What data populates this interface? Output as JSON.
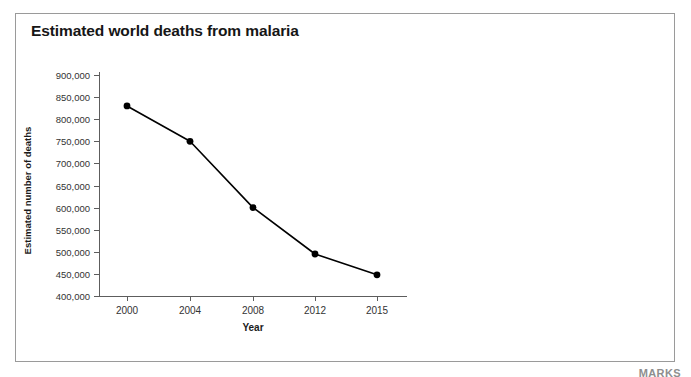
{
  "panel": {
    "accent_color": "#3f3f3f",
    "border_color": "#9a9a9a",
    "background": "#ffffff"
  },
  "watermark": {
    "text": "MARKS"
  },
  "chart_data": {
    "type": "line",
    "title": "Estimated world deaths from malaria",
    "xlabel": "Year",
    "ylabel": "Estimated number of deaths",
    "categories": [
      "2000",
      "2004",
      "2008",
      "2012",
      "2015"
    ],
    "x": [
      2000,
      2004,
      2008,
      2012,
      2015
    ],
    "values": [
      830000,
      750000,
      600000,
      495000,
      448000
    ],
    "point_labels": [
      "830,000",
      "750,000",
      "600,000",
      "495,000",
      "448,000"
    ],
    "ylim": [
      400000,
      900000
    ],
    "ytick_values": [
      900000,
      850000,
      800000,
      750000,
      700000,
      650000,
      600000,
      550000,
      500000,
      450000,
      400000
    ],
    "ytick_labels": [
      "900,000",
      "850,000",
      "800,000",
      "750,000",
      "700,000",
      "650,000",
      "600,000",
      "550,000",
      "500,000",
      "450,000",
      "400,000"
    ],
    "xtick_labels": [
      "2000",
      "2004",
      "2008",
      "2012",
      "2015"
    ],
    "grid": false,
    "legend": false,
    "series_color": "#000000",
    "marker": "circle",
    "marker_color": "#000000",
    "axis_color": "#5d5d5d"
  }
}
